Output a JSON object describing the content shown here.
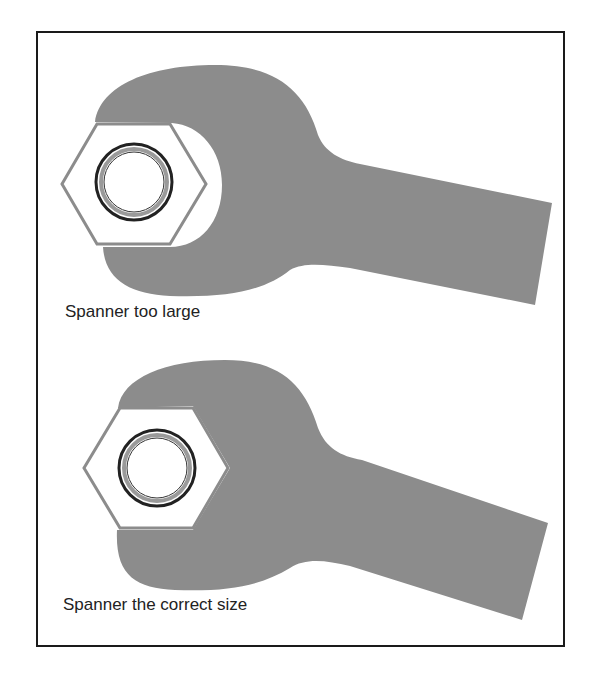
{
  "figure": {
    "panels": [
      {
        "id": "too-large",
        "caption": "Spanner too large"
      },
      {
        "id": "correct-size",
        "caption": "Spanner the correct size"
      }
    ],
    "colors": {
      "spanner": "#8c8c8c",
      "nut_outline": "#8c8c8c",
      "ring": "#222222",
      "frame": "#1a1a1a",
      "text": "#222222"
    }
  }
}
